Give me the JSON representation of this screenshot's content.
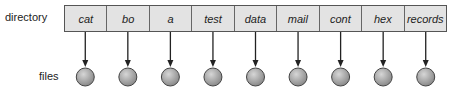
{
  "labels": {
    "directory": "directory",
    "files": "files"
  },
  "entries": [
    "cat",
    "bo",
    "a",
    "test",
    "data",
    "mail",
    "cont",
    "hex",
    "records"
  ],
  "colors": {
    "cell_fill": "#e3e3e3",
    "circle_fill": "#a9a9a9",
    "stroke": "#333333"
  }
}
